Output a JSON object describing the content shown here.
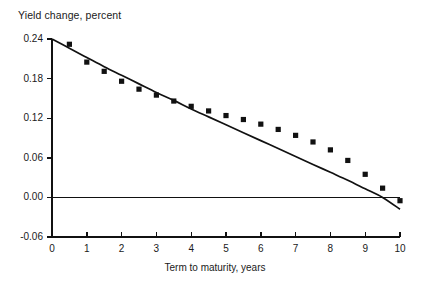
{
  "chart_data": {
    "type": "scatter",
    "title": "Yield change, percent",
    "xlabel": "Term to maturity, years",
    "ylabel": "Yield change, percent",
    "xlim": [
      0,
      10
    ],
    "ylim": [
      -0.06,
      0.24
    ],
    "grid": false,
    "legend": "none",
    "xticks": [
      "0",
      "1",
      "2",
      "3",
      "4",
      "5",
      "6",
      "7",
      "8",
      "9",
      "10"
    ],
    "xtick_values": [
      0,
      1,
      2,
      3,
      4,
      5,
      6,
      7,
      8,
      9,
      10
    ],
    "yticks": [
      "0.24",
      "0.18",
      "0.12",
      "0.06",
      "0.00",
      "-0.06"
    ],
    "ytick_values": [
      0.24,
      0.18,
      0.12,
      0.06,
      0.0,
      -0.06
    ],
    "series": [
      {
        "name": "Observed yield change",
        "type": "scatter",
        "marker": "square",
        "color": "#111111",
        "x": [
          0.5,
          1.0,
          1.5,
          2.0,
          2.5,
          3.0,
          3.5,
          4.0,
          4.5,
          5.0,
          5.5,
          6.0,
          6.5,
          7.0,
          7.5,
          8.0,
          8.5,
          9.0,
          9.5,
          10.0
        ],
        "y": [
          0.232,
          0.205,
          0.191,
          0.176,
          0.164,
          0.155,
          0.146,
          0.138,
          0.131,
          0.124,
          0.118,
          0.111,
          0.103,
          0.094,
          0.084,
          0.072,
          0.056,
          0.035,
          0.014,
          -0.005
        ]
      },
      {
        "name": "Fitted curve",
        "type": "line",
        "color": "#111111",
        "x": [
          0,
          0.5,
          1,
          1.5,
          2,
          2.5,
          3,
          3.5,
          4,
          4.5,
          5,
          5.5,
          6,
          6.5,
          7,
          7.5,
          8,
          8.5,
          9,
          9.5,
          10
        ],
        "y": [
          0.24,
          0.226,
          0.212,
          0.198,
          0.185,
          0.172,
          0.159,
          0.147,
          0.134,
          0.122,
          0.11,
          0.098,
          0.086,
          0.074,
          0.062,
          0.05,
          0.038,
          0.026,
          0.013,
          0.0,
          -0.018
        ]
      },
      {
        "name": "Zero reference line",
        "type": "line",
        "color": "#111111",
        "x": [
          0,
          10
        ],
        "y": [
          0.0,
          0.0
        ]
      }
    ]
  },
  "axes": {
    "origin_px": {
      "x": 52,
      "y": 237
    },
    "x_px_per_unit": 34.8,
    "y_px_per_unit": 660.0
  }
}
